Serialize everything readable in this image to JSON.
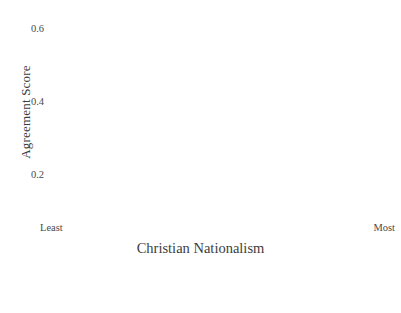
{
  "chart_data": {
    "type": "line",
    "title": "",
    "xlabel": "Christian Nationalism",
    "ylabel": "Agreement Score",
    "x": [
      0,
      1
    ],
    "xtick_labels": [
      "Least",
      "Most"
    ],
    "ytick_labels": [
      "0.2",
      "0.4",
      "0.6"
    ],
    "yticks": [
      0.2,
      0.4,
      0.6
    ],
    "ylim": [
      0.1,
      0.65
    ],
    "xlim": [
      0,
      1
    ],
    "grid": false,
    "legend_position": "bottom",
    "confidence_bands": true,
    "series": [
      {
        "name": "Express their views on political questions.",
        "legend_line1": "Express their views",
        "legend_line2": "on political questions.",
        "style": "solid",
        "color": "#b9b9b9",
        "values": [
          0.181,
          0.601
        ],
        "ci_lower": [
          0.16,
          0.578
        ],
        "ci_upper": [
          0.202,
          0.624
        ]
      },
      {
        "name": "Come out for or against candidates",
        "legend_line1": "Come out for or",
        "legend_line2": "against candidates",
        "style": "dashed",
        "color": "#adadad",
        "values": [
          0.134,
          0.589
        ],
        "ci_lower": [
          0.113,
          0.566
        ],
        "ci_upper": [
          0.155,
          0.612
        ]
      },
      {
        "name": "Help register people to vote.",
        "legend_line1": "Help register",
        "legend_line2": "people to vote.",
        "style": "dotted",
        "color": "#cfcfcf",
        "values": [
          0.47,
          0.645
        ],
        "ci_lower": [
          0.448,
          0.622
        ],
        "ci_upper": [
          0.492,
          0.668
        ]
      }
    ]
  },
  "axes": {
    "y_title": "Agreement Score",
    "x_title": "Christian Nationalism",
    "x_left_label": "Least",
    "x_right_label": "Most"
  },
  "colors": {
    "text": "#3c3c3c",
    "line_solid": "#b9b9b9",
    "line_dashed": "#adadad",
    "line_dotted": "#cfcfcf",
    "band": "#e8e8e8",
    "background": "#ffffff"
  }
}
